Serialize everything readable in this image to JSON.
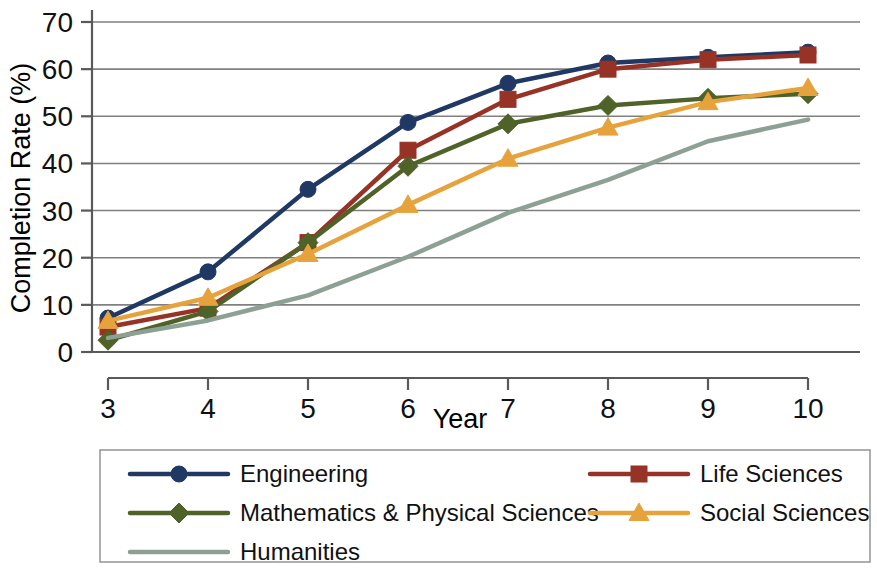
{
  "chart_data": {
    "type": "line",
    "title": "",
    "xlabel": "Year",
    "ylabel": "Completion Rate (%)",
    "x": [
      3,
      4,
      5,
      6,
      7,
      8,
      9,
      10
    ],
    "xtick_labels": [
      "3",
      "4",
      "5",
      "6",
      "7",
      "8",
      "9",
      "10"
    ],
    "ytick_labels": [
      "0",
      "10",
      "20",
      "30",
      "40",
      "50",
      "60",
      "70"
    ],
    "xlim": [
      3,
      10
    ],
    "ylim": [
      0,
      70
    ],
    "grid": "horizontal",
    "legend_position": "below-plot",
    "series": [
      {
        "name": "Engineering",
        "color": "#1F3864",
        "marker": "circle",
        "values": [
          7.2,
          17.0,
          34.5,
          48.7,
          57.0,
          61.3,
          62.5,
          63.6
        ]
      },
      {
        "name": "Life Sciences",
        "color": "#963326",
        "marker": "square",
        "values": [
          5.3,
          9.3,
          23.2,
          42.8,
          53.6,
          60.0,
          62.0,
          63.0
        ]
      },
      {
        "name": "Mathematics & Physical Sciences",
        "color": "#4F6228",
        "marker": "diamond",
        "values": [
          2.5,
          8.6,
          23.2,
          39.4,
          48.4,
          52.3,
          53.8,
          54.8
        ]
      },
      {
        "name": "Social Sciences",
        "color": "#E6A33C",
        "marker": "triangle",
        "values": [
          6.6,
          11.5,
          20.8,
          31.2,
          41.0,
          47.6,
          53.0,
          56.0
        ]
      },
      {
        "name": "Humanities",
        "color": "#8CA193",
        "marker": "line",
        "values": [
          3.0,
          6.7,
          12.0,
          20.2,
          29.5,
          36.5,
          44.7,
          49.3
        ]
      }
    ]
  },
  "legend": {
    "entries": [
      {
        "label": "Engineering"
      },
      {
        "label": "Life Sciences"
      },
      {
        "label": "Mathematics & Physical Sciences"
      },
      {
        "label": "Social Sciences"
      },
      {
        "label": "Humanities"
      }
    ]
  }
}
